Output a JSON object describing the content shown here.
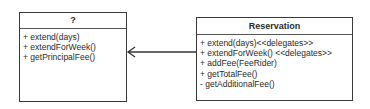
{
  "left_class": {
    "name": "?",
    "operations": [
      "+ extend(days)",
      "+ extendForWeek()",
      "+ getPrincipalFee()"
    ]
  },
  "right_class": {
    "name": "Reservation",
    "operations": [
      "+ extend(days)<<delegates>>",
      "+ extendForWeek() <<delegates>>",
      "+ addFee(FeeRider)",
      "+ getTotalFee()",
      "- getAdditionalFee()"
    ]
  },
  "association": {
    "from": "Reservation",
    "to": "?",
    "arrow": "open-arrowhead"
  }
}
